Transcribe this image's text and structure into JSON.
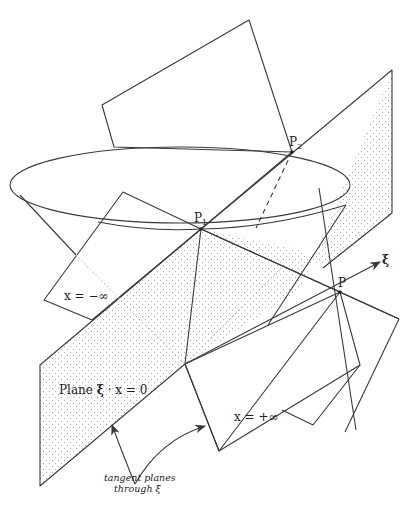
{
  "figure": {
    "type": "geometric diagram"
  },
  "labels": {
    "p1": "P",
    "p1_sub": "1",
    "p2": "P",
    "p2_sub": "2",
    "p": "P",
    "xi": "ξ",
    "minus_inf": "x = −∞",
    "plus_inf": "x = +∞",
    "plane_prefix": "Plane ",
    "plane_xi": "ξ",
    "plane_eq": " · x = 0",
    "caption_line1": "tangent planes",
    "caption_line2": "through ξ"
  },
  "colors": {
    "line": "#3a3a3a",
    "shade_dots": "#bdbdbd",
    "background": "#ffffff"
  }
}
